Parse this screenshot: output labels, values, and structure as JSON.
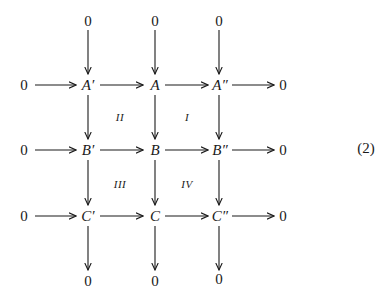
{
  "diagram": {
    "equation_label": "(2)",
    "nodes": {
      "top": [
        "0",
        "0",
        "0"
      ],
      "row_a": {
        "left": "0",
        "a_prime": "A′",
        "a": "A",
        "a_dprime": "A″",
        "right": "0"
      },
      "row_b": {
        "left": "0",
        "b_prime": "B′",
        "b": "B",
        "b_dprime": "B″",
        "right": "0"
      },
      "row_c": {
        "left": "0",
        "c_prime": "C′",
        "c": "C",
        "c_dprime": "C″",
        "right": "0"
      },
      "bottom": [
        "0",
        "0",
        "0"
      ]
    },
    "regions": {
      "ii": "II",
      "i": "I",
      "iii": "III",
      "iv": "IV"
    },
    "arrows": {
      "horizontal": [
        [
          "0",
          "A′"
        ],
        [
          "A′",
          "A"
        ],
        [
          "A",
          "A″"
        ],
        [
          "A″",
          "0"
        ],
        [
          "0",
          "B′"
        ],
        [
          "B′",
          "B"
        ],
        [
          "B",
          "B″"
        ],
        [
          "B″",
          "0"
        ],
        [
          "0",
          "C′"
        ],
        [
          "C′",
          "C"
        ],
        [
          "C",
          "C″"
        ],
        [
          "C″",
          "0"
        ]
      ],
      "vertical": [
        [
          "0",
          "A′"
        ],
        [
          "A′",
          "B′"
        ],
        [
          "B′",
          "C′"
        ],
        [
          "C′",
          "0"
        ],
        [
          "0",
          "A"
        ],
        [
          "A",
          "B"
        ],
        [
          "B",
          "C"
        ],
        [
          "C",
          "0"
        ],
        [
          "0",
          "A″"
        ],
        [
          "A″",
          "B″"
        ],
        [
          "B″",
          "C″"
        ],
        [
          "C″",
          "0"
        ]
      ]
    }
  }
}
